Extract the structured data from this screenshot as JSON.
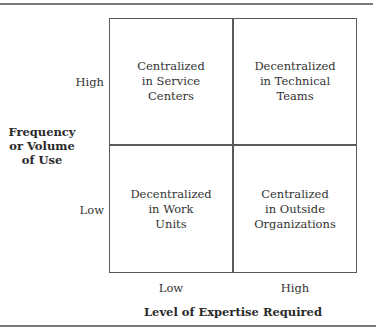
{
  "diagram": {
    "type": "2x2-matrix",
    "y_axis": {
      "title_lines": [
        "Frequency",
        "or Volume",
        "of Use"
      ],
      "ticks": {
        "high": "High",
        "low": "Low"
      }
    },
    "x_axis": {
      "title": "Level of Expertise Required",
      "ticks": {
        "low": "Low",
        "high": "High"
      }
    },
    "cells": {
      "top_left": {
        "lines": [
          "Centralized",
          "in Service",
          "Centers"
        ]
      },
      "top_right": {
        "lines": [
          "Decentralized",
          "in Technical",
          "Teams"
        ]
      },
      "bottom_left": {
        "lines": [
          "Decentralized",
          "in Work",
          "Units"
        ]
      },
      "bottom_right": {
        "lines": [
          "Centralized",
          "in Outside",
          "Organizations"
        ]
      }
    },
    "colors": {
      "grid_line": "#5a5a5a",
      "rule": "#7a7a7a",
      "text": "#333333"
    }
  }
}
